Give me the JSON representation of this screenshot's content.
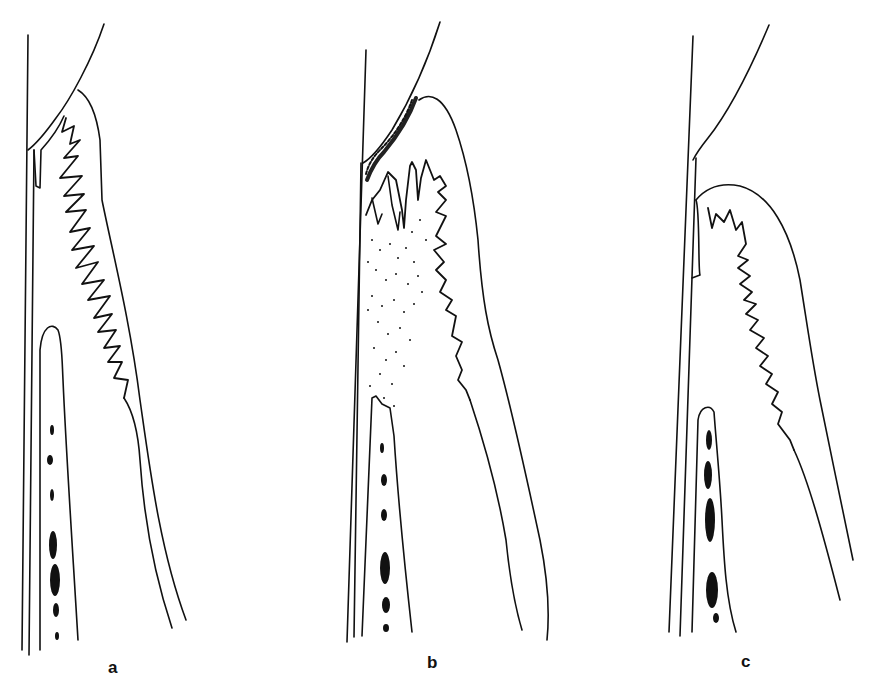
{
  "figure": {
    "panels": [
      {
        "id": "a",
        "label": "a"
      },
      {
        "id": "b",
        "label": "b"
      },
      {
        "id": "c",
        "label": "c"
      }
    ],
    "colors": {
      "background": "#ffffff",
      "line": "#111111"
    }
  }
}
